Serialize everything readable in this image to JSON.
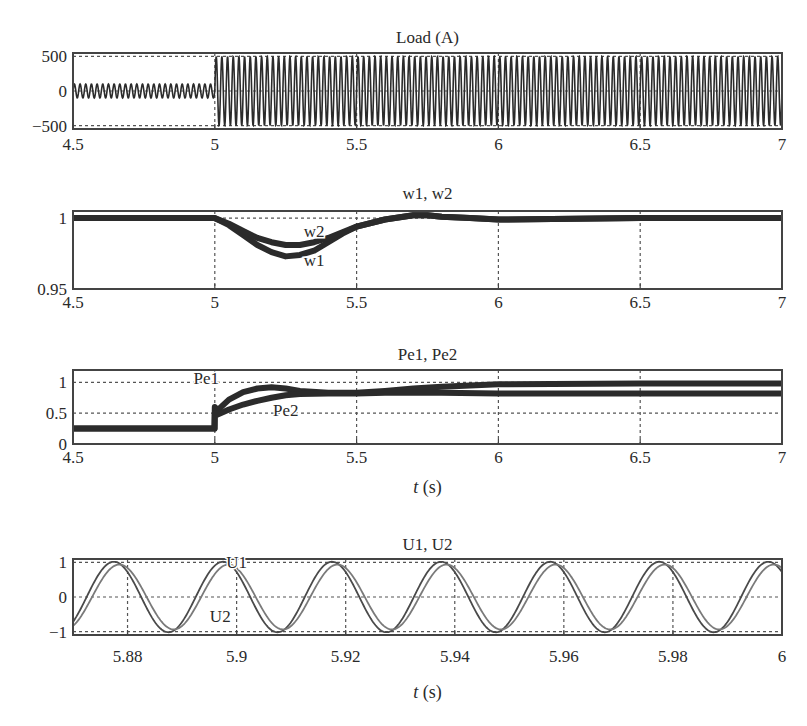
{
  "chart_data": [
    {
      "type": "line",
      "title": "Load (A)",
      "xlabel": "",
      "ylabel": "",
      "xlim": [
        4.5,
        7
      ],
      "ylim": [
        -550,
        550
      ],
      "xticks": [
        4.5,
        5,
        5.5,
        6,
        6.5,
        7
      ],
      "xtick_labels": [
        "4.5",
        "5",
        "5.5",
        "6",
        "6.5",
        "7"
      ],
      "yticks": [
        -500,
        0,
        500
      ],
      "ytick_labels": [
        "−500",
        "0",
        "500"
      ],
      "grid": true,
      "series": [
        {
          "name": "Load current",
          "description": "AC load current; amplitude ~100 A before t=5 s, step to ~500 A after t=5 s",
          "frequency_hz": 50,
          "amplitude_segments": [
            {
              "t_start": 4.5,
              "t_end": 5.0,
              "amplitude": 100
            },
            {
              "t_start": 5.0,
              "t_end": 7.0,
              "amplitude": 500
            }
          ]
        }
      ]
    },
    {
      "type": "line",
      "title": "w1, w2",
      "xlabel": "",
      "ylabel": "",
      "xlim": [
        4.5,
        7
      ],
      "ylim": [
        0.95,
        1.005
      ],
      "xticks": [
        4.5,
        5,
        5.5,
        6,
        6.5,
        7
      ],
      "xtick_labels": [
        "4.5",
        "5",
        "5.5",
        "6",
        "6.5",
        "7"
      ],
      "yticks": [
        0.95,
        1
      ],
      "ytick_labels": [
        "0.95",
        "1"
      ],
      "grid": true,
      "annotations": [
        {
          "text": "w2",
          "x": 5.35,
          "y": 0.987
        },
        {
          "text": "w1",
          "x": 5.35,
          "y": 0.966
        }
      ],
      "series": [
        {
          "name": "w1",
          "x": [
            4.5,
            5.0,
            5.05,
            5.1,
            5.15,
            5.2,
            5.25,
            5.3,
            5.35,
            5.4,
            5.45,
            5.5,
            5.6,
            5.7,
            5.75,
            5.8,
            5.9,
            6.0,
            6.5,
            7.0
          ],
          "values": [
            1.0,
            1.0,
            0.995,
            0.988,
            0.981,
            0.976,
            0.973,
            0.974,
            0.977,
            0.983,
            0.989,
            0.994,
            0.999,
            1.002,
            1.002,
            1.001,
            1.0,
            0.999,
            1.0,
            1.0
          ]
        },
        {
          "name": "w2",
          "x": [
            4.5,
            5.0,
            5.05,
            5.1,
            5.15,
            5.2,
            5.25,
            5.3,
            5.35,
            5.4,
            5.45,
            5.5,
            5.6,
            5.7,
            5.75,
            5.8,
            5.9,
            6.0,
            6.5,
            7.0
          ],
          "values": [
            1.0,
            1.0,
            0.996,
            0.991,
            0.986,
            0.983,
            0.981,
            0.981,
            0.983,
            0.986,
            0.99,
            0.994,
            0.999,
            1.002,
            1.002,
            1.001,
            1.0,
            0.999,
            1.0,
            1.0
          ]
        }
      ]
    },
    {
      "type": "line",
      "title": "Pe1, Pe2",
      "xlabel": "t (s)",
      "ylabel": "",
      "xlim": [
        4.5,
        7
      ],
      "ylim": [
        0,
        1.2
      ],
      "xticks": [
        4.5,
        5,
        5.5,
        6,
        6.5,
        7
      ],
      "xtick_labels": [
        "4.5",
        "5",
        "5.5",
        "6",
        "6.5",
        "7"
      ],
      "yticks": [
        0,
        0.5,
        1
      ],
      "ytick_labels": [
        "0",
        "0.5",
        "1"
      ],
      "grid": true,
      "annotations": [
        {
          "text": "Pe1",
          "x": 4.97,
          "y": 0.98
        },
        {
          "text": "Pe2",
          "x": 5.25,
          "y": 0.45
        }
      ],
      "series": [
        {
          "name": "Pe1",
          "x": [
            4.5,
            4.999,
            5.0,
            5.01,
            5.05,
            5.1,
            5.15,
            5.2,
            5.25,
            5.3,
            5.4,
            5.5,
            5.6,
            5.7,
            5.8,
            6.0,
            6.5,
            7.0
          ],
          "values": [
            0.25,
            0.25,
            0.6,
            0.55,
            0.72,
            0.84,
            0.9,
            0.92,
            0.9,
            0.86,
            0.83,
            0.83,
            0.86,
            0.9,
            0.93,
            0.97,
            0.98,
            0.98
          ]
        },
        {
          "name": "Pe2",
          "x": [
            4.5,
            4.999,
            5.0,
            5.01,
            5.05,
            5.1,
            5.15,
            5.2,
            5.25,
            5.3,
            5.4,
            5.5,
            5.6,
            5.7,
            5.8,
            6.0,
            6.5,
            7.0
          ],
          "values": [
            0.25,
            0.25,
            0.5,
            0.48,
            0.56,
            0.64,
            0.7,
            0.75,
            0.79,
            0.81,
            0.82,
            0.82,
            0.83,
            0.83,
            0.83,
            0.82,
            0.82,
            0.82
          ]
        }
      ]
    },
    {
      "type": "line",
      "title": "U1, U2",
      "xlabel": "t (s)",
      "ylabel": "",
      "xlim": [
        5.87,
        6.0
      ],
      "ylim": [
        -1.1,
        1.1
      ],
      "xticks": [
        5.88,
        5.9,
        5.92,
        5.94,
        5.96,
        5.98,
        6.0
      ],
      "xtick_labels": [
        "5.88",
        "5.9",
        "5.92",
        "5.94",
        "5.96",
        "5.98",
        "6"
      ],
      "yticks": [
        -1,
        0,
        1
      ],
      "ytick_labels": [
        "−1",
        "0",
        "1"
      ],
      "grid": true,
      "annotations": [
        {
          "text": "U1",
          "x": 5.9,
          "y": 0.85
        },
        {
          "text": "U2",
          "x": 5.897,
          "y": -0.72
        }
      ],
      "series": [
        {
          "name": "U1",
          "frequency_hz": 50,
          "amplitude": 1.02,
          "first_peak_t": 5.8775
        },
        {
          "name": "U2",
          "frequency_hz": 50,
          "amplitude": 0.94,
          "first_peak_t": 5.8785
        }
      ]
    }
  ]
}
